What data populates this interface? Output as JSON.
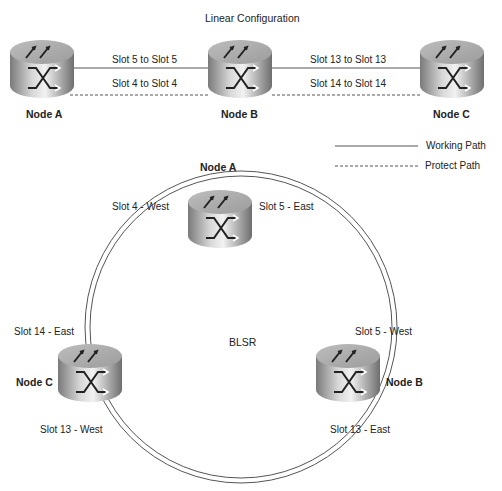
{
  "linear": {
    "title": "Linear Configuration",
    "nodes": [
      {
        "label": "Node A"
      },
      {
        "label": "Node B"
      },
      {
        "label": "Node C"
      }
    ],
    "links": [
      {
        "working": "Slot 5 to Slot 5",
        "protect": "Slot 4 to Slot 4"
      },
      {
        "working": "Slot 13 to Slot 13",
        "protect": "Slot 14 to Slot 14"
      }
    ]
  },
  "legend": {
    "working": "Working Path",
    "protect": "Protect Path"
  },
  "blsr": {
    "title": "BLSR",
    "nodes": [
      {
        "label": "Node A",
        "west": "Slot 4 - West",
        "east": "Slot 5 - East"
      },
      {
        "label": "Node B",
        "west": "Slot 5 - West",
        "east": "Slot 13 - East"
      },
      {
        "label": "Node C",
        "west": "Slot 13 - West",
        "east": "Slot 14 - East"
      }
    ]
  },
  "colors": {
    "line": "#555555",
    "router_body": "#9a9a9a",
    "router_top": "#c8c8c8"
  }
}
